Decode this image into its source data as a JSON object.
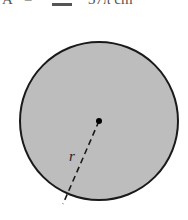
{
  "header": {
    "variable": "A",
    "equals": "=",
    "answer_box": "",
    "value": "37π cm"
  },
  "diagram": {
    "shape": "circle",
    "fill_color": "#bdbdbd",
    "stroke_color": "#1a1a1a",
    "center": [
      99,
      121
    ],
    "radius_px": 79,
    "radius_line_end": [
      63,
      204
    ],
    "radius_label": "r"
  }
}
